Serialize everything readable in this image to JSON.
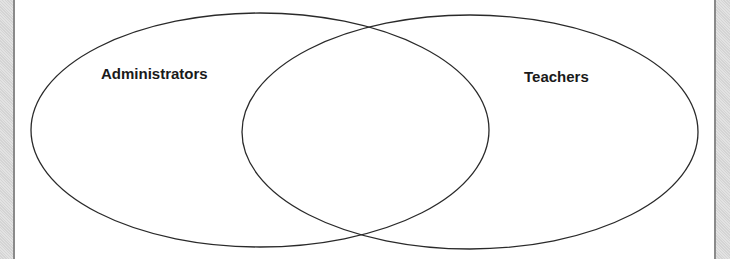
{
  "diagram": {
    "type": "venn",
    "sets": [
      {
        "label": "Administrators",
        "cx": 260,
        "cy": 130,
        "rx": 229,
        "ry": 117
      },
      {
        "label": "Teachers",
        "cx": 470,
        "cy": 132,
        "rx": 228,
        "ry": 117
      }
    ],
    "stroke_color": "#2a2a2a",
    "frame_color": "#8a8a8a"
  }
}
